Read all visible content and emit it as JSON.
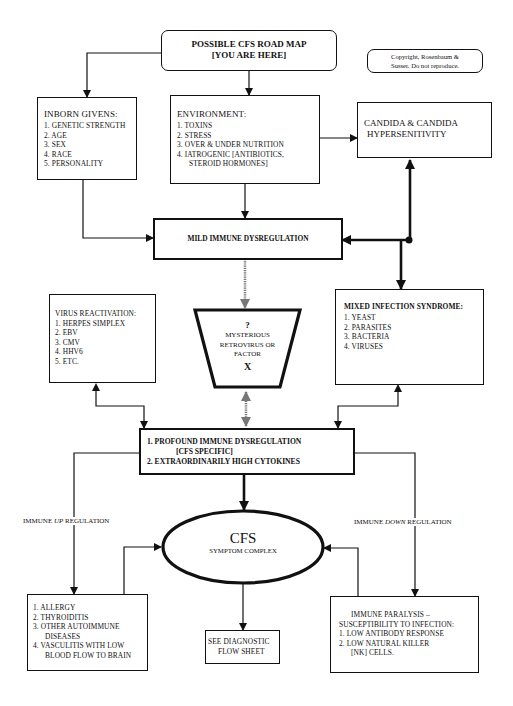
{
  "title_box": {
    "line1": "POSSIBLE CFS ROAD MAP",
    "line2": "[YOU ARE HERE]"
  },
  "copyright": {
    "line1": "Copyright, Rosenbaum &",
    "line2": "Susser. Do not reproduce."
  },
  "inborn_givens": {
    "heading": "INBORN  GIVENS:",
    "items": [
      "1. GENETIC STRENGTH",
      "2. AGE",
      "3. SEX",
      "4. RACE",
      "5. PERSONALITY"
    ]
  },
  "environment": {
    "heading": "ENVIRONMENT:",
    "items": [
      "1. TOXINS",
      "2. STRESS",
      "3. OVER & UNDER NUTRITION",
      "4. IATROGENIC [ANTIBIOTICS,",
      "STEROID HORMONES]"
    ]
  },
  "candida": {
    "line1": "CANDIDA & CANDIDA",
    "line2": "HYPERSENITIVITY"
  },
  "mild_immune": {
    "label": "MILD IMMUNE DYSREGULATION"
  },
  "virus_reactivation": {
    "heading": "VIRUS REACTIVATION:",
    "items": [
      "1. HERPES SIMPLEX",
      "2. EBV",
      "3. CMV",
      "4. HHV6",
      "5. ETC."
    ]
  },
  "mysterious": {
    "q": "?",
    "line1": "MYSTERIOUS",
    "line2": "RETROVIRUS OR",
    "line3": "FACTOR",
    "x": "X"
  },
  "mixed_infection": {
    "heading": "MIXED INFECTION SYNDROME:",
    "items": [
      "1. YEAST",
      "2. PARASITES",
      "3. BACTERIA",
      "4. VIRUSES"
    ]
  },
  "profound": {
    "line1": "1. PROFOUND IMMUNE DYSREGULATION",
    "line2": "[CFS SPECIFIC]",
    "line3": "2. EXTRAORDINARILY HIGH CYTOKINES"
  },
  "cfs": {
    "title": "CFS",
    "subtitle": "SYMPTOM COMPLEX"
  },
  "edge_labels": {
    "up_prefix": "IMMUNE ",
    "up_em": "UP",
    "up_suffix": " REGULATION",
    "down_prefix": "IMMUNE ",
    "down_em": "DOWN",
    "down_suffix": " REGULATION"
  },
  "up_regulation_box": {
    "items": [
      "1.  ALLERGY",
      "2.  THYROIDITIS",
      "3.  OTHER  AUTOIMMUNE",
      "DISEASES",
      "4. VASCULITIS WITH LOW",
      "BLOOD FLOW TO BRAIN"
    ]
  },
  "diagnostic": {
    "line1": "SEE DIAGNOSTIC",
    "line2": "FLOW SHEET"
  },
  "immune_paralysis": {
    "line1": "IMMUNE PARALYSIS –",
    "line2": "SUSCEPTIBILITY TO INFECTION:",
    "line3": "1. LOW ANTIBODY RESPONSE",
    "line4": "2. LOW NATURAL KILLER",
    "line5": "[NK] CELLS."
  }
}
